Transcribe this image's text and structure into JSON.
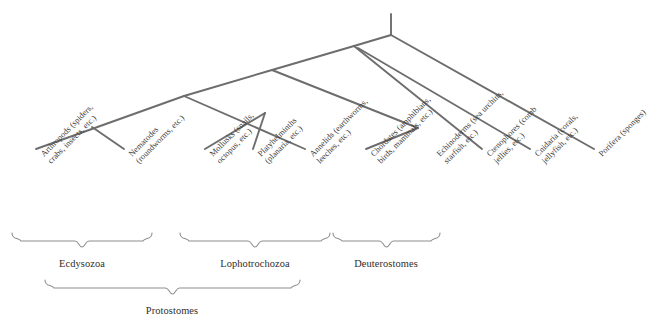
{
  "figure": {
    "line_color": "#6d6d6d",
    "brace_color": "#8e8e8e",
    "background": "#ffffff",
    "text_color": "#3c3a38"
  },
  "taxa": [
    {
      "id": "arthropods",
      "name": "Arthropods",
      "lines": [
        "Arthropods (spiders,",
        "crabs, insects, etc.)"
      ],
      "tip_x": 36,
      "tip_y": 149,
      "label_x": 39,
      "label_y": 152
    },
    {
      "id": "nematodes",
      "name": "Nematodes",
      "lines": [
        "Nematodes",
        "(roundworms, etc.)"
      ],
      "tip_x": 124,
      "tip_y": 149,
      "label_x": 127,
      "label_y": 152
    },
    {
      "id": "mollusks",
      "name": "Mollusks",
      "lines": [
        "Mollusks (snails,",
        "octopus, etc.)"
      ],
      "tip_x": 205,
      "tip_y": 149,
      "label_x": 208,
      "label_y": 152
    },
    {
      "id": "platyhelminths",
      "name": "Platyhelminths",
      "lines": [
        "Platyhelminths",
        "(planaria, etc.)"
      ],
      "tip_x": 253,
      "tip_y": 149,
      "label_x": 256,
      "label_y": 152
    },
    {
      "id": "annelids",
      "name": "Annelids",
      "lines": [
        "Annelids (earthworms,",
        "leeches, etc.)"
      ],
      "tip_x": 305,
      "tip_y": 149,
      "label_x": 308,
      "label_y": 152
    },
    {
      "id": "chordates",
      "name": "Chordates",
      "lines": [
        "Chordates (amphibians,",
        "birds, mammals, etc.)"
      ],
      "tip_x": 366,
      "tip_y": 149,
      "label_x": 369,
      "label_y": 152
    },
    {
      "id": "echinoderms",
      "name": "Echinoderms",
      "lines": [
        "Echinoderms (sea urchins,",
        "starfish, etc.)"
      ],
      "tip_x": 432,
      "tip_y": 149,
      "label_x": 435,
      "label_y": 152
    },
    {
      "id": "ctenophores",
      "name": "Ctenophores",
      "lines": [
        "Ctenophores (comb",
        "jellies, etc.)"
      ],
      "tip_x": 482,
      "tip_y": 149,
      "label_x": 485,
      "label_y": 152
    },
    {
      "id": "cnidaria",
      "name": "Cnidaria",
      "lines": [
        "Cnidaria (corals,",
        "jellyfish, etc.)"
      ],
      "tip_x": 530,
      "tip_y": 149,
      "label_x": 533,
      "label_y": 152
    },
    {
      "id": "porifera",
      "name": "Porifera",
      "lines": [
        "Porifera (sponges)"
      ],
      "tip_x": 594,
      "tip_y": 149,
      "label_x": 597,
      "label_y": 152
    }
  ],
  "tree": {
    "root_stem": {
      "x": 391,
      "y_top": 14,
      "y_bottom": 35
    },
    "nodes": [
      {
        "id": "root",
        "x": 391,
        "y": 35
      },
      {
        "id": "bilateria-plus",
        "x": 354,
        "y": 46
      },
      {
        "id": "bilateria",
        "x": 272,
        "y": 70
      },
      {
        "id": "protostomes",
        "x": 184,
        "y": 96
      },
      {
        "id": "ecdysozoa",
        "x": 92,
        "y": 127
      },
      {
        "id": "lophotrochozoa",
        "x": 265,
        "y": 113
      },
      {
        "id": "deuterostomes",
        "x": 418,
        "y": 128
      }
    ],
    "segments": [
      {
        "from": "root-stem-top",
        "x1": 391,
        "y1": 14,
        "x2": 391,
        "y2": 35
      },
      {
        "from": "root",
        "x1": 391,
        "y1": 35,
        "x2": 354,
        "y2": 46
      },
      {
        "from": "root",
        "x1": 391,
        "y1": 35,
        "x2": 594,
        "y2": 149
      },
      {
        "from": "bilateria-plus",
        "x1": 354,
        "y1": 46,
        "x2": 272,
        "y2": 70
      },
      {
        "from": "bilateria-plus",
        "x1": 354,
        "y1": 46,
        "x2": 482,
        "y2": 149
      },
      {
        "from": "bilateria-plus",
        "x1": 358,
        "y1": 48,
        "x2": 530,
        "y2": 149
      },
      {
        "from": "bilateria",
        "x1": 272,
        "y1": 70,
        "x2": 184,
        "y2": 96
      },
      {
        "from": "bilateria",
        "x1": 272,
        "y1": 70,
        "x2": 418,
        "y2": 128
      },
      {
        "from": "protostomes",
        "x1": 184,
        "y1": 96,
        "x2": 36,
        "y2": 149
      },
      {
        "from": "protostomes",
        "x1": 184,
        "y1": 96,
        "x2": 305,
        "y2": 149
      },
      {
        "from": "ecdysozoa",
        "x1": 92,
        "y1": 127,
        "x2": 124,
        "y2": 149
      },
      {
        "from": "lophotrochozoa",
        "x1": 265,
        "y1": 113,
        "x2": 205,
        "y2": 149
      },
      {
        "from": "lophotrochozoa",
        "x1": 265,
        "y1": 113,
        "x2": 253,
        "y2": 149
      },
      {
        "from": "deuterostomes",
        "x1": 418,
        "y1": 128,
        "x2": 366,
        "y2": 149
      }
    ]
  },
  "groups": [
    {
      "id": "ecdysozoa",
      "label": "Ecdysozoa",
      "brace": {
        "left": 12,
        "right": 152,
        "top": 233,
        "depth": 14
      },
      "label_x": 82,
      "label_y": 258
    },
    {
      "id": "lophotrochozoa",
      "label": "Lophotrochozoa",
      "brace": {
        "left": 180,
        "right": 330,
        "top": 233,
        "depth": 14
      },
      "label_x": 255,
      "label_y": 258
    },
    {
      "id": "deuterostomes",
      "label": "Deuterostomes",
      "brace": {
        "left": 333,
        "right": 440,
        "top": 233,
        "depth": 14
      },
      "label_x": 386,
      "label_y": 258
    },
    {
      "id": "protostomes",
      "label": "Protostomes",
      "brace": {
        "left": 45,
        "right": 300,
        "top": 280,
        "depth": 14
      },
      "label_x": 172,
      "label_y": 305
    }
  ]
}
